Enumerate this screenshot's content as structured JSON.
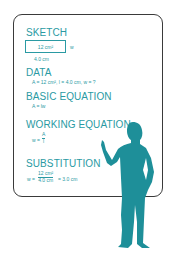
{
  "colors": {
    "accent": "#2a9aa3",
    "frame": "#3a3a3a",
    "background": "#ffffff"
  },
  "board": {
    "sections": [
      {
        "heading": "SKETCH",
        "box_label": "12 cm²",
        "side_label": "w",
        "bottom_label": "4.0 cm"
      },
      {
        "heading": "DATA",
        "line": "A = 12 cm², l = 4.0 cm, w = ?"
      },
      {
        "heading": "BASIC EQUATION",
        "line": "A = lw"
      },
      {
        "heading": "WORKING EQUATION",
        "lhs": "w =",
        "numerator": "A",
        "denominator": "l"
      },
      {
        "heading": "SUBSTITUTION",
        "lhs": "w =",
        "numerator": "12 cm²",
        "denominator": "4.0 cm",
        "rhs": "= 3.0 cm"
      }
    ]
  },
  "figure": {
    "icon": "person-presenting-silhouette-icon"
  }
}
